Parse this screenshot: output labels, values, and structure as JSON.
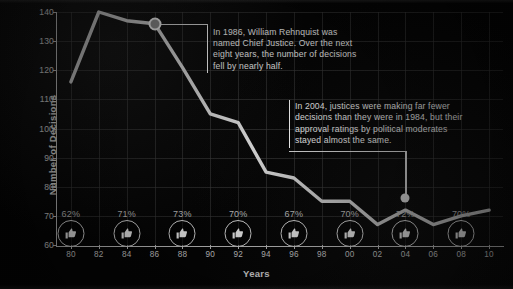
{
  "chart_data": {
    "type": "line",
    "title": "",
    "xlabel": "Years",
    "ylabel": "Number of Decisions",
    "xlim": [
      1980,
      2010
    ],
    "ylim": [
      60,
      140
    ],
    "grid": true,
    "legend": "none",
    "x_ticks": [
      "80",
      "82",
      "84",
      "86",
      "88",
      "90",
      "92",
      "94",
      "96",
      "98",
      "00",
      "02",
      "04",
      "06",
      "08",
      "10"
    ],
    "y_ticks": [
      "60",
      "70",
      "80",
      "90",
      "100",
      "110",
      "120",
      "130",
      "140"
    ],
    "x": [
      1980,
      1982,
      1984,
      1986,
      1988,
      1990,
      1992,
      1994,
      1996,
      1998,
      2000,
      2002,
      2004,
      2006,
      2008,
      2010
    ],
    "values": [
      116,
      140,
      137,
      136,
      121,
      105,
      102,
      85,
      83,
      75,
      75,
      67,
      72,
      67,
      70,
      72
    ],
    "series": [
      {
        "name": "Number of Decisions",
        "values": [
          116,
          140,
          137,
          136,
          121,
          105,
          102,
          85,
          83,
          75,
          75,
          67,
          72,
          67,
          70,
          72
        ]
      }
    ],
    "approval_label": "% approval by political moderates",
    "approval_points": [
      {
        "year": "80",
        "pct": "62%"
      },
      {
        "year": "84",
        "pct": "71%"
      },
      {
        "year": "88",
        "pct": "73%"
      },
      {
        "year": "92",
        "pct": "70%"
      },
      {
        "year": "96",
        "pct": "67%"
      },
      {
        "year": "00",
        "pct": "70%"
      },
      {
        "year": "04",
        "pct": "72%"
      },
      {
        "year": "08",
        "pct": "70%"
      }
    ],
    "annotations": [
      {
        "id": "rehnquist-1986",
        "text": "In 1986, William Rehnquist was named Chief Justice. Over the next eight years, the number of decisions fell by nearly half.",
        "anchor_year": 1986,
        "anchor_value": 136
      },
      {
        "id": "moderates-2004",
        "text": "In 2004, justices were making far fewer decisions than they were in 1984, but their approval ratings by political moderates stayed almost the same.",
        "anchor_year": 2004,
        "anchor_value": 72
      }
    ],
    "colors": {
      "background": "#050505",
      "line": "#d8d8d8",
      "grid": "#3b3b3b",
      "axis": "#cfcfcf",
      "text": "#f2f2f2",
      "percent_text": "#c9c9c9"
    }
  }
}
